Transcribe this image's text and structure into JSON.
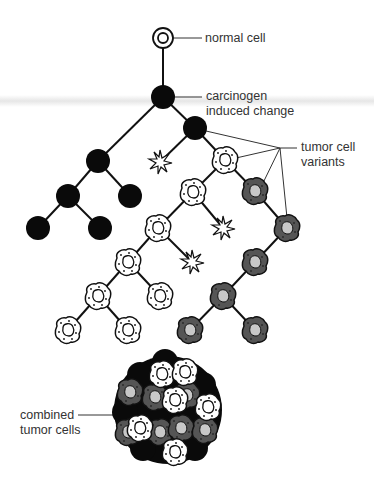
{
  "labels": {
    "normal_cell": "normal cell",
    "carcinogen_line1": "carcinogen",
    "carcinogen_line2": "induced change",
    "variants_line1": "tumor cell",
    "variants_line2": "variants",
    "combined_line1": "combined",
    "combined_line2": "tumor cells"
  },
  "legend_types": [
    "normal cell",
    "transformed (black) cell",
    "light tumor variant",
    "dark tumor variant",
    "dead cell (starburst)"
  ],
  "colors": {
    "black_cell": "#0a0a0a",
    "light_variant": "#ffffff",
    "dark_variant": "#555555",
    "nucleus_dark": "#c8c8c8",
    "line": "#111111"
  }
}
